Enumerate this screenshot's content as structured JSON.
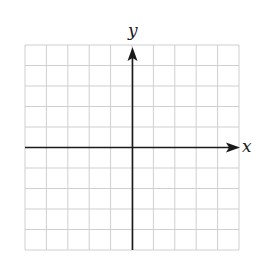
{
  "diagram": {
    "type": "coordinate-plane",
    "grid": {
      "columns": 10,
      "rows": 10,
      "line_color": "#cfcfcf",
      "axis_color": "#1a1a1a"
    },
    "axes": {
      "x_label": "x",
      "y_label": "y",
      "x_arrow": "positive",
      "y_arrow": "positive"
    }
  }
}
